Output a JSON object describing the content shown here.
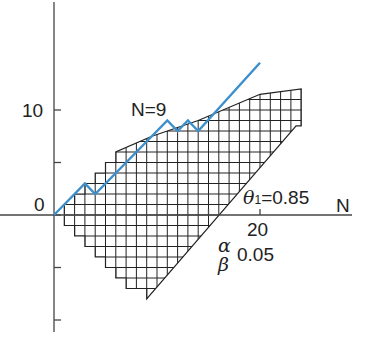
{
  "chart_data": {
    "type": "line",
    "title": "",
    "xlabel": "N",
    "ylabel": "",
    "x_axis_tick_labels": [
      {
        "value": 20,
        "label": "20"
      }
    ],
    "x_axis_ticks": [
      15,
      20
    ],
    "y_axis_tick_labels": [
      {
        "value": 0,
        "label": "0"
      },
      {
        "value": 10,
        "label": "10"
      }
    ],
    "y_axis_ticks": [
      -10,
      -5,
      0,
      5,
      10
    ],
    "xlim": [
      0,
      27
    ],
    "ylim": [
      -12,
      20
    ],
    "grid": false,
    "annotations": [
      {
        "text": "N=9",
        "x": 9.5,
        "y": 11.5
      },
      {
        "text": "θ1=0.85",
        "x": 20,
        "y": 2
      },
      {
        "text": "α",
        "x": 15.5,
        "y": -2.5
      },
      {
        "text": "β",
        "x": 15.5,
        "y": -5
      },
      {
        "text": "0.05",
        "x": 20,
        "y": -3.8
      }
    ],
    "continuation_region": {
      "description": "cross-hatched region between upper and lower staircase boundaries",
      "upper_boundary": [
        [
          1,
          0
        ],
        [
          1,
          1
        ],
        [
          2,
          1
        ],
        [
          2,
          2
        ],
        [
          3,
          2
        ],
        [
          3,
          3
        ],
        [
          4,
          3
        ],
        [
          4,
          4
        ],
        [
          5,
          4
        ],
        [
          5,
          5
        ],
        [
          6,
          5
        ],
        [
          6,
          6
        ],
        [
          9.5,
          7.5
        ],
        [
          14,
          9
        ],
        [
          20,
          11.5
        ],
        [
          24,
          12
        ]
      ],
      "lower_boundary": [
        [
          1,
          0
        ],
        [
          1,
          -1
        ],
        [
          2,
          -1
        ],
        [
          2,
          -2
        ],
        [
          3,
          -2
        ],
        [
          3,
          -3
        ],
        [
          4,
          -3
        ],
        [
          4,
          -4
        ],
        [
          5,
          -4
        ],
        [
          5,
          -5
        ],
        [
          6,
          -5
        ],
        [
          6,
          -6
        ],
        [
          7,
          -6
        ],
        [
          7,
          -7
        ],
        [
          9,
          -7
        ],
        [
          9,
          -8
        ],
        [
          23.5,
          8.5
        ],
        [
          24,
          8.5
        ]
      ]
    },
    "series": [
      {
        "name": "sample path",
        "color": "#3d8fcc",
        "x": [
          0,
          3,
          4,
          9,
          11,
          12,
          13,
          14,
          20
        ],
        "y": [
          0,
          3,
          2,
          7,
          9,
          8,
          9,
          8,
          14.5
        ]
      }
    ]
  },
  "labels": {
    "y_10": "10",
    "y_0": "0",
    "x_20": "20",
    "x_axis_name": "N",
    "n9": "N=9",
    "theta": "θ",
    "theta_sub": "1",
    "theta_val": "=0.85",
    "alpha": "α",
    "beta": "β",
    "alpha_beta_val": "0.05"
  }
}
